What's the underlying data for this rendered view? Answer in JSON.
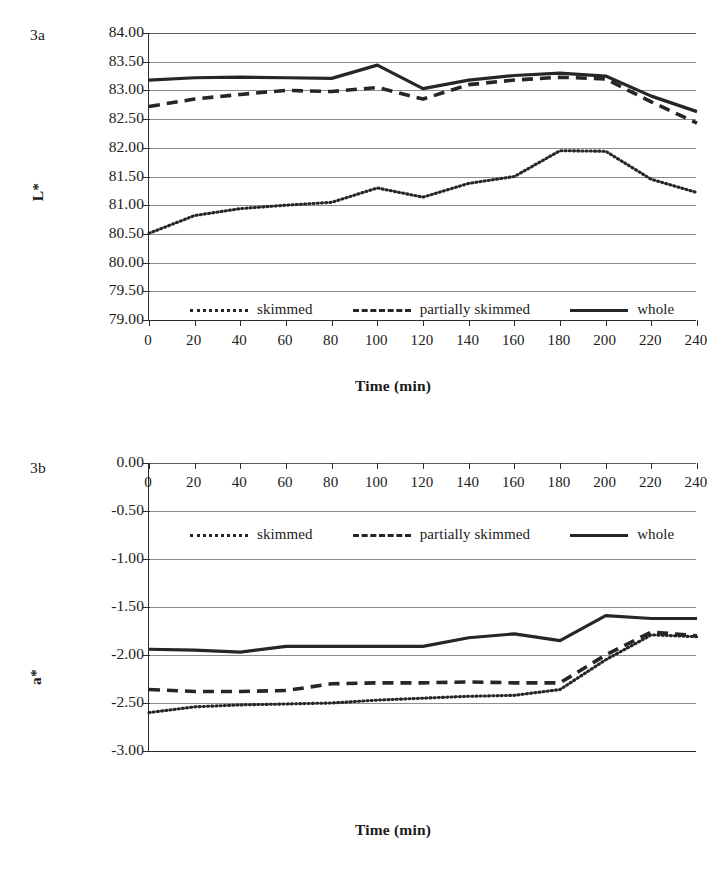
{
  "figure": {
    "panels": [
      {
        "tag": "3a",
        "ylabel": "L*",
        "xlabel": "Time (min)"
      },
      {
        "tag": "3b",
        "ylabel": "a*",
        "xlabel": "Time (min)"
      }
    ],
    "legend_items": [
      {
        "label": "skimmed",
        "key": "dotted-line-key"
      },
      {
        "label": "partially skimmed",
        "key": "dashed-line-key"
      },
      {
        "label": "whole",
        "key": "solid-line-key"
      }
    ],
    "colors": {
      "line": "#262626",
      "gridline": "#8d8d8d",
      "axis": "#2b2b2b",
      "background": "#ffffff"
    }
  },
  "chart_data": [
    {
      "type": "line",
      "title": "3a",
      "xlabel": "Time (min)",
      "ylabel": "L*",
      "x": [
        0,
        20,
        40,
        60,
        80,
        100,
        120,
        140,
        160,
        180,
        200,
        220,
        240
      ],
      "xlim": [
        0,
        240
      ],
      "ylim": [
        79.0,
        84.0
      ],
      "ytick_labels": [
        "84.00",
        "83.50",
        "83.00",
        "82.50",
        "82.00",
        "81.50",
        "81.00",
        "80.50",
        "80.00",
        "79.50",
        "79.00"
      ],
      "ytick_values": [
        84.0,
        83.5,
        83.0,
        82.5,
        82.0,
        81.5,
        81.0,
        80.5,
        80.0,
        79.5,
        79.0
      ],
      "xtick_labels": [
        "0",
        "20",
        "40",
        "60",
        "80",
        "100",
        "120",
        "140",
        "160",
        "180",
        "200",
        "220",
        "240"
      ],
      "grid": true,
      "legend_position": "inside-bottom",
      "series": [
        {
          "name": "skimmed",
          "style": "dotted",
          "values": [
            80.51,
            80.82,
            80.94,
            81.0,
            81.05,
            81.3,
            81.14,
            81.38,
            81.5,
            81.95,
            81.94,
            81.45,
            81.22
          ]
        },
        {
          "name": "partially skimmed",
          "style": "dashed",
          "values": [
            82.72,
            82.85,
            82.93,
            83.0,
            82.98,
            83.05,
            82.85,
            83.1,
            83.18,
            83.23,
            83.2,
            82.8,
            82.43
          ]
        },
        {
          "name": "whole",
          "style": "solid",
          "values": [
            83.18,
            83.22,
            83.23,
            83.22,
            83.21,
            83.44,
            83.03,
            83.18,
            83.26,
            83.3,
            83.25,
            82.9,
            82.63
          ]
        }
      ]
    },
    {
      "type": "line",
      "title": "3b",
      "xlabel": "Time (min)",
      "ylabel": "a*",
      "x": [
        0,
        20,
        40,
        60,
        80,
        100,
        120,
        140,
        160,
        180,
        200,
        220,
        240
      ],
      "xlim": [
        0,
        240
      ],
      "ylim": [
        -3.0,
        0.0
      ],
      "ytick_labels": [
        "0.00",
        "-0.50",
        "-1.00",
        "-1.50",
        "-2.00",
        "-2.50",
        "-3.00"
      ],
      "ytick_values": [
        0.0,
        -0.5,
        -1.0,
        -1.5,
        -2.0,
        -2.5,
        -3.0
      ],
      "xtick_labels": [
        "0",
        "20",
        "40",
        "60",
        "80",
        "100",
        "120",
        "140",
        "160",
        "180",
        "200",
        "220",
        "240"
      ],
      "grid": true,
      "legend_position": "inside-top",
      "series": [
        {
          "name": "skimmed",
          "style": "dotted",
          "values": [
            -2.6,
            -2.54,
            -2.52,
            -2.51,
            -2.5,
            -2.47,
            -2.45,
            -2.43,
            -2.42,
            -2.36,
            -2.05,
            -1.79,
            -1.81
          ]
        },
        {
          "name": "partially skimmed",
          "style": "dashed",
          "values": [
            -2.36,
            -2.38,
            -2.38,
            -2.37,
            -2.3,
            -2.29,
            -2.29,
            -2.28,
            -2.29,
            -2.29,
            -2.0,
            -1.76,
            -1.8
          ]
        },
        {
          "name": "whole",
          "style": "solid",
          "values": [
            -1.94,
            -1.95,
            -1.97,
            -1.91,
            -1.91,
            -1.91,
            -1.91,
            -1.82,
            -1.78,
            -1.85,
            -1.59,
            -1.62,
            -1.62
          ]
        }
      ]
    }
  ]
}
